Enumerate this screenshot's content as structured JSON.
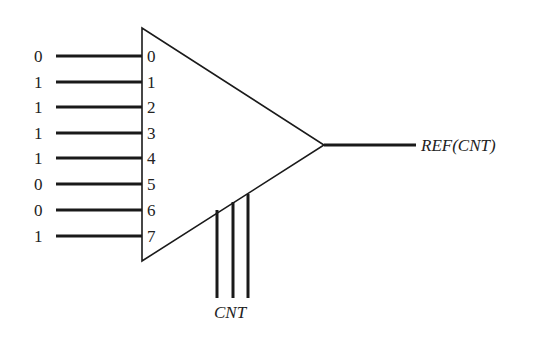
{
  "diagram": {
    "type": "multiplexer",
    "inputs": [
      {
        "index": "0",
        "value": "0",
        "y": 56
      },
      {
        "index": "1",
        "value": "1",
        "y": 82
      },
      {
        "index": "2",
        "value": "1",
        "y": 107
      },
      {
        "index": "3",
        "value": "1",
        "y": 133
      },
      {
        "index": "4",
        "value": "1",
        "y": 158
      },
      {
        "index": "5",
        "value": "0",
        "y": 184
      },
      {
        "index": "6",
        "value": "0",
        "y": 210
      },
      {
        "index": "7",
        "value": "1",
        "y": 236
      }
    ],
    "control_label": "CNT",
    "output_label": "REF(CNT)",
    "colors": {
      "stroke": "#1a1a1a",
      "background": "#ffffff"
    }
  }
}
